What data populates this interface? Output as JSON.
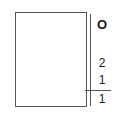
{
  "diagram": {
    "labels": {
      "top": "O",
      "middle": "2",
      "lower": "1",
      "bottom": "1"
    },
    "colors": {
      "line": "#555555",
      "text": "#1a1a1a",
      "background": "#ffffff"
    }
  }
}
